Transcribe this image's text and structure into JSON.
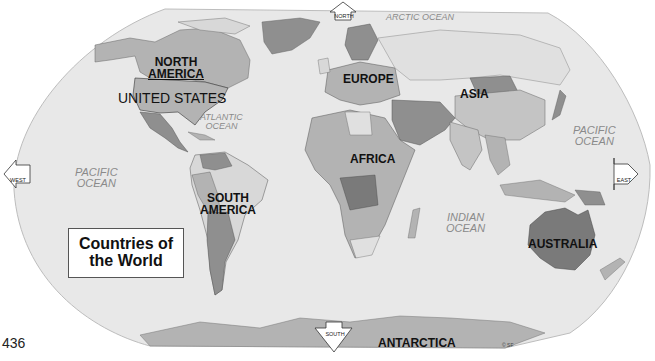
{
  "map": {
    "title_lines": [
      "Countries of",
      "the World"
    ],
    "page_number": "436",
    "copyright": "© SF",
    "colors": {
      "ocean": "#e8e8e8",
      "page": "#ffffff",
      "land_light": "#d8d8d8",
      "land_mid": "#b3b3b3",
      "land_dark": "#8f8f8f",
      "land_darker": "#7a7a7a",
      "label_text": "#111111",
      "ocean_text": "#8a8a8a"
    },
    "continents": [
      {
        "name": "NORTH AMERICA",
        "lines": [
          "NORTH",
          "AMERICA"
        ]
      },
      {
        "name": "SOUTH AMERICA",
        "lines": [
          "SOUTH",
          "AMERICA"
        ]
      },
      {
        "name": "EUROPE",
        "lines": [
          "EUROPE"
        ]
      },
      {
        "name": "ASIA",
        "lines": [
          "ASIA"
        ]
      },
      {
        "name": "AFRICA",
        "lines": [
          "AFRICA"
        ]
      },
      {
        "name": "AUSTRALIA",
        "lines": [
          "AUSTRALIA"
        ]
      },
      {
        "name": "ANTARCTICA",
        "lines": [
          "ANTARCTICA"
        ]
      }
    ],
    "highlighted_country": "UNITED STATES",
    "oceans": [
      {
        "name": "ARCTIC OCEAN",
        "lines": [
          "ARCTIC OCEAN"
        ]
      },
      {
        "name": "ATLANTIC OCEAN",
        "lines": [
          "ATLANTIC",
          "OCEAN"
        ]
      },
      {
        "name": "PACIFIC OCEAN (west)",
        "lines": [
          "PACIFIC",
          "OCEAN"
        ]
      },
      {
        "name": "PACIFIC OCEAN (east)",
        "lines": [
          "PACIFIC",
          "OCEAN"
        ]
      },
      {
        "name": "INDIAN OCEAN",
        "lines": [
          "INDIAN",
          "OCEAN"
        ]
      }
    ],
    "compass": {
      "north": "NORTH",
      "south": "SOUTH",
      "east": "EAST",
      "west": "WEST"
    }
  }
}
